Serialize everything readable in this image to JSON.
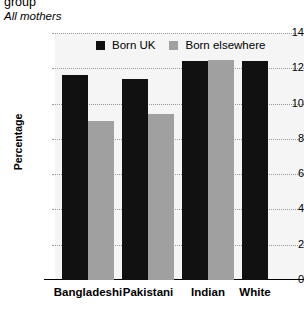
{
  "header": {
    "title_cut": "group",
    "subtitle": "All mothers"
  },
  "legend": {
    "position": "top-center",
    "entries": [
      {
        "label": "Born UK",
        "color": "#111111"
      },
      {
        "label": "Born elsewhere",
        "color": "#a0a0a0"
      }
    ]
  },
  "chart_data": {
    "type": "bar",
    "title": "group",
    "subtitle": "All mothers",
    "xlabel": "",
    "ylabel": "Percentage",
    "ylim": [
      0,
      14
    ],
    "yticks": [
      0,
      2,
      4,
      6,
      8,
      10,
      12,
      14
    ],
    "ytick_labels": [
      "0",
      "2",
      "4",
      "6",
      "8",
      "10",
      "12",
      "14"
    ],
    "grid": true,
    "grid_style": "dotted-horizontal",
    "categories": [
      "Bangladeshi",
      "Pakistani",
      "Indian",
      "White"
    ],
    "series": [
      {
        "name": "Born UK",
        "color": "#111111",
        "values": [
          11.6,
          11.4,
          12.4,
          12.4
        ]
      },
      {
        "name": "Born elsewhere",
        "color": "#a0a0a0",
        "values": [
          9.0,
          9.4,
          12.5,
          null
        ]
      }
    ],
    "plot_background": "#f5f5f5"
  },
  "geometry": {
    "baseline_y": 280,
    "top_y": 33,
    "px_per_unit": 17.64,
    "bar_width": 26,
    "groups_x": [
      62,
      122,
      182,
      242
    ]
  }
}
